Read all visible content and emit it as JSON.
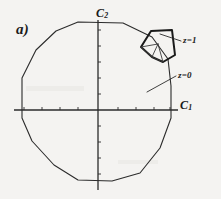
{
  "figure": {
    "panel_label": "a)",
    "background_color": "#f4f3f1",
    "ink_color": "#2b2b2b",
    "axes": {
      "horizontal_label": "C",
      "horizontal_subscript": "1",
      "vertical_label": "C",
      "vertical_subscript": "2",
      "origin_x": 98,
      "origin_y": 110,
      "horizontal_extent": [
        14,
        178
      ],
      "vertical_extent": [
        20,
        190
      ],
      "tick_count_horizontal": 9,
      "tick_count_vertical": 9,
      "tick_length": 3
    },
    "annotations": [
      {
        "id": "z1",
        "text": "z=1",
        "text_x": 183,
        "text_y": 36,
        "leader_from": [
          181,
          41
        ],
        "leader_to": [
          160,
          34
        ]
      },
      {
        "id": "z0",
        "text": "z=0",
        "text_x": 178,
        "text_y": 71,
        "leader_from": [
          176,
          76
        ],
        "leader_to": [
          147,
          92
        ]
      }
    ],
    "main_polygon": {
      "name": "brillouin-zone-outline",
      "sides": 14,
      "stroke_width": 1.1,
      "vertices": [
        [
          78,
          22
        ],
        [
          123,
          23
        ],
        [
          152,
          37
        ],
        [
          168,
          59
        ],
        [
          171,
          86
        ],
        [
          171,
          118
        ],
        [
          160,
          148
        ],
        [
          140,
          173
        ],
        [
          112,
          181
        ],
        [
          78,
          180
        ],
        [
          54,
          165
        ],
        [
          32,
          141
        ],
        [
          22,
          118
        ],
        [
          22,
          78
        ],
        [
          36,
          50
        ],
        [
          56,
          31
        ]
      ]
    },
    "inset_cell": {
      "name": "irreducible-wedge-cell",
      "stroke_width": 2.0,
      "vertices": [
        [
          141,
          47
        ],
        [
          151,
          31
        ],
        [
          172,
          30
        ],
        [
          175,
          55
        ],
        [
          163,
          62
        ],
        [
          152,
          57
        ]
      ],
      "internal_edges": [
        [
          [
            141,
            47
          ],
          [
            152,
            57
          ]
        ],
        [
          [
            152,
            57
          ],
          [
            163,
            62
          ]
        ],
        [
          [
            141,
            47
          ],
          [
            158,
            44
          ]
        ],
        [
          [
            158,
            44
          ],
          [
            163,
            62
          ]
        ],
        [
          [
            152,
            57
          ],
          [
            158,
            44
          ]
        ]
      ]
    }
  }
}
